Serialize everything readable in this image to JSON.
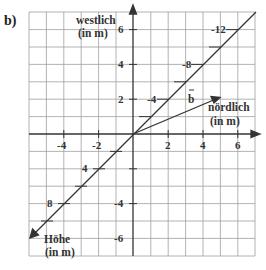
{
  "part_label": "b)",
  "axes": {
    "vertical": {
      "label_line1": "westlich",
      "label_line2": "(in m)",
      "ticks": [
        {
          "value": 6,
          "label": "6"
        },
        {
          "value": 4,
          "label": "4"
        },
        {
          "value": 2,
          "label": "2"
        },
        {
          "value": -4,
          "label": "-4"
        },
        {
          "value": -6,
          "label": "-6"
        }
      ]
    },
    "horizontal": {
      "label_line1": "nördlich",
      "label_line2": "(in m)",
      "ticks": [
        {
          "value": -4,
          "label": "-4"
        },
        {
          "value": -2,
          "label": "-2"
        },
        {
          "value": 2,
          "label": "2"
        },
        {
          "value": 4,
          "label": "4"
        },
        {
          "value": 6,
          "label": "6"
        }
      ]
    },
    "diagonal": {
      "label_line1": "Höhe",
      "label_line2": "(in m)",
      "ticks": [
        {
          "label": "-12"
        },
        {
          "label": "-8"
        },
        {
          "label": "-4"
        },
        {
          "label": "4"
        },
        {
          "label": "8"
        }
      ]
    }
  },
  "vector": {
    "name": "b⃗",
    "label": "b",
    "end": [
      5,
      2
    ]
  },
  "colors": {
    "grid": "#9a9a9a",
    "axis": "#333333",
    "background": "#ffffff"
  }
}
